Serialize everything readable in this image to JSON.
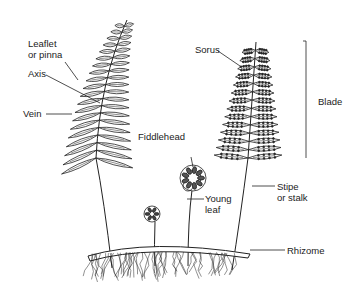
{
  "diagram": {
    "labels": {
      "leaflet_line1": "Leaflet",
      "leaflet_line2": "or pinna",
      "axis": "Axis",
      "vein": "Vein",
      "fiddlehead": "Fiddlehead",
      "young_leaf_line1": "Young",
      "young_leaf_line2": "leaf",
      "sorus": "Sorus",
      "blade": "Blade",
      "stipe_line1": "Stipe",
      "stipe_line2": "or stalk",
      "rhizome": "Rhizome"
    },
    "colors": {
      "ink": "#222222",
      "background": "#ffffff"
    }
  }
}
